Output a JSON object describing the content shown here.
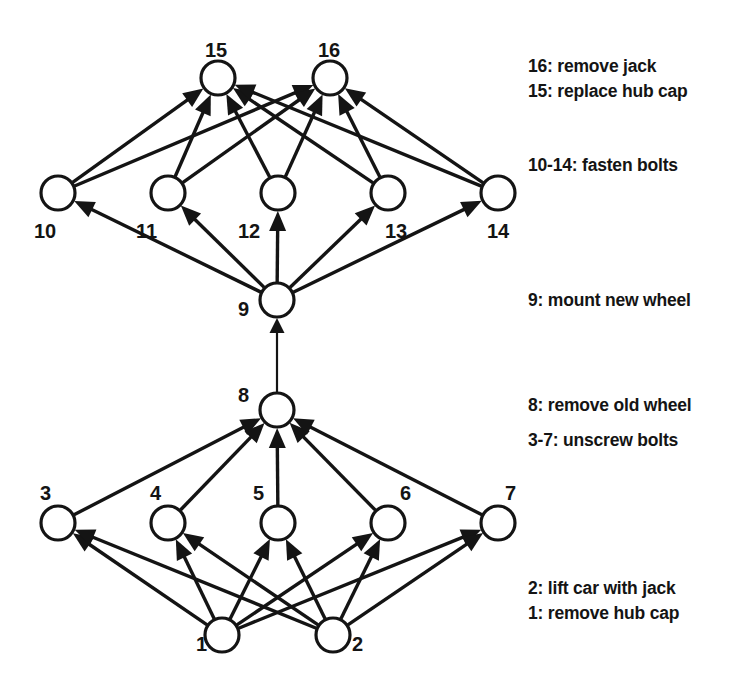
{
  "diagram": {
    "background_color": "#ffffff",
    "stroke_color": "#141414",
    "nodes": [
      {
        "id": "1",
        "label": "1",
        "cx": 222,
        "cy": 635,
        "r": 17,
        "label_x": 196,
        "label_y": 651
      },
      {
        "id": "2",
        "label": "2",
        "cx": 333,
        "cy": 635,
        "r": 17,
        "label_x": 352,
        "label_y": 651
      },
      {
        "id": "3",
        "label": "3",
        "cx": 58,
        "cy": 523,
        "r": 17,
        "label_x": 40,
        "label_y": 500
      },
      {
        "id": "4",
        "label": "4",
        "cx": 168,
        "cy": 523,
        "r": 17,
        "label_x": 150,
        "label_y": 500
      },
      {
        "id": "5",
        "label": "5",
        "cx": 278,
        "cy": 523,
        "r": 17,
        "label_x": 253,
        "label_y": 500
      },
      {
        "id": "6",
        "label": "6",
        "cx": 388,
        "cy": 523,
        "r": 17,
        "label_x": 400,
        "label_y": 500
      },
      {
        "id": "7",
        "label": "7",
        "cx": 498,
        "cy": 523,
        "r": 17,
        "label_x": 505,
        "label_y": 500
      },
      {
        "id": "8",
        "label": "8",
        "cx": 277,
        "cy": 410,
        "r": 17,
        "label_x": 238,
        "label_y": 402
      },
      {
        "id": "9",
        "label": "9",
        "cx": 277,
        "cy": 300,
        "r": 17,
        "label_x": 238,
        "label_y": 316
      },
      {
        "id": "10",
        "label": "10",
        "cx": 58,
        "cy": 193,
        "r": 17,
        "label_x": 34,
        "label_y": 238
      },
      {
        "id": "11",
        "label": "11",
        "cx": 168,
        "cy": 193,
        "r": 17,
        "label_x": 136,
        "label_y": 238
      },
      {
        "id": "12",
        "label": "12",
        "cx": 278,
        "cy": 193,
        "r": 17,
        "label_x": 238,
        "label_y": 238
      },
      {
        "id": "13",
        "label": "13",
        "cx": 388,
        "cy": 193,
        "r": 17,
        "label_x": 385,
        "label_y": 238
      },
      {
        "id": "14",
        "label": "14",
        "cx": 498,
        "cy": 193,
        "r": 17,
        "label_x": 487,
        "label_y": 238
      },
      {
        "id": "15",
        "label": "15",
        "cx": 218,
        "cy": 78,
        "r": 17,
        "label_x": 205,
        "label_y": 57
      },
      {
        "id": "16",
        "label": "16",
        "cx": 330,
        "cy": 78,
        "r": 17,
        "label_x": 318,
        "label_y": 57
      }
    ],
    "edges": [
      {
        "from": "1",
        "to": "3"
      },
      {
        "from": "1",
        "to": "4"
      },
      {
        "from": "1",
        "to": "5"
      },
      {
        "from": "1",
        "to": "6"
      },
      {
        "from": "1",
        "to": "7"
      },
      {
        "from": "2",
        "to": "3"
      },
      {
        "from": "2",
        "to": "4"
      },
      {
        "from": "2",
        "to": "5"
      },
      {
        "from": "2",
        "to": "6"
      },
      {
        "from": "2",
        "to": "7"
      },
      {
        "from": "3",
        "to": "8"
      },
      {
        "from": "4",
        "to": "8"
      },
      {
        "from": "5",
        "to": "8"
      },
      {
        "from": "6",
        "to": "8"
      },
      {
        "from": "7",
        "to": "8"
      },
      {
        "from": "8",
        "to": "9"
      },
      {
        "from": "9",
        "to": "10"
      },
      {
        "from": "9",
        "to": "11"
      },
      {
        "from": "9",
        "to": "12"
      },
      {
        "from": "9",
        "to": "13"
      },
      {
        "from": "9",
        "to": "14"
      },
      {
        "from": "10",
        "to": "15"
      },
      {
        "from": "11",
        "to": "15"
      },
      {
        "from": "12",
        "to": "15"
      },
      {
        "from": "13",
        "to": "15"
      },
      {
        "from": "14",
        "to": "15"
      },
      {
        "from": "10",
        "to": "16"
      },
      {
        "from": "11",
        "to": "16"
      },
      {
        "from": "12",
        "to": "16"
      },
      {
        "from": "13",
        "to": "16"
      },
      {
        "from": "14",
        "to": "16"
      }
    ],
    "legend": [
      {
        "id": "legend-16",
        "text": "16: remove jack",
        "x": 528,
        "y": 56
      },
      {
        "id": "legend-15",
        "text": "15: replace hub cap",
        "x": 528,
        "y": 81
      },
      {
        "id": "legend-10-14",
        "text": "10-14: fasten bolts",
        "x": 528,
        "y": 155
      },
      {
        "id": "legend-9",
        "text": "9: mount new wheel",
        "x": 528,
        "y": 290
      },
      {
        "id": "legend-8",
        "text": "8: remove old wheel",
        "x": 528,
        "y": 395
      },
      {
        "id": "legend-3-7",
        "text": "3-7: unscrew bolts",
        "x": 528,
        "y": 430
      },
      {
        "id": "legend-2",
        "text": "2: lift car with jack",
        "x": 528,
        "y": 578
      },
      {
        "id": "legend-1",
        "text": "1: remove hub cap",
        "x": 528,
        "y": 603
      }
    ]
  }
}
